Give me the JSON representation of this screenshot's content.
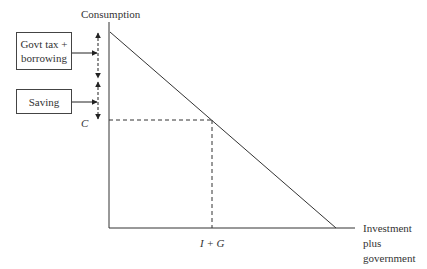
{
  "diagram": {
    "y_axis_label": "Consumption",
    "x_axis_label_lines": [
      "Investment",
      "plus",
      "government"
    ],
    "x_marker_label": "I + G",
    "y_marker_label": "C",
    "boxes": [
      {
        "label_lines": [
          "Govt tax +",
          "borrowing"
        ]
      },
      {
        "label_lines": [
          "Saving"
        ]
      }
    ],
    "colors": {
      "line": "#333333",
      "background": "#ffffff"
    }
  }
}
